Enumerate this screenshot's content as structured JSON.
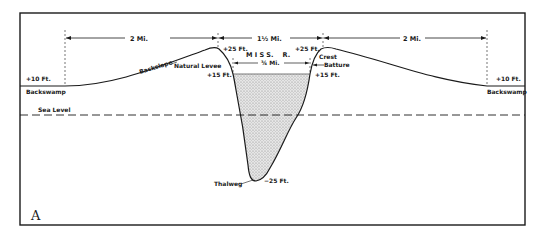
{
  "figure": {
    "panel_letter": "A",
    "colors": {
      "ink": "#1a1a1a",
      "background": "#ffffff",
      "water_fill": "#d6d6d6"
    }
  },
  "dimensions": {
    "left_width": "2 Mi.",
    "channel_span": "1½ Mi.",
    "right_width": "2 Mi.",
    "river_width": "¾ Mi."
  },
  "labels": {
    "river_name": "M I S S.    R.",
    "backslope": "Backslope",
    "natural_levee": "Natural Levee",
    "crest": "Crest",
    "batture": "Batture",
    "sea_level": "Sea Level",
    "thalweg": "Thalweg",
    "backswamp_left": "Backswamp",
    "backswamp_right": "Backswamp"
  },
  "elevations": {
    "left_backswamp": "+10 Ft.",
    "right_backswamp": "+10 Ft.",
    "left_crest": "+25 Ft.",
    "right_crest": "+25 Ft.",
    "left_water": "+15 Ft.",
    "right_water": "+15 Ft.",
    "thalweg_depth": "−25 Ft."
  }
}
